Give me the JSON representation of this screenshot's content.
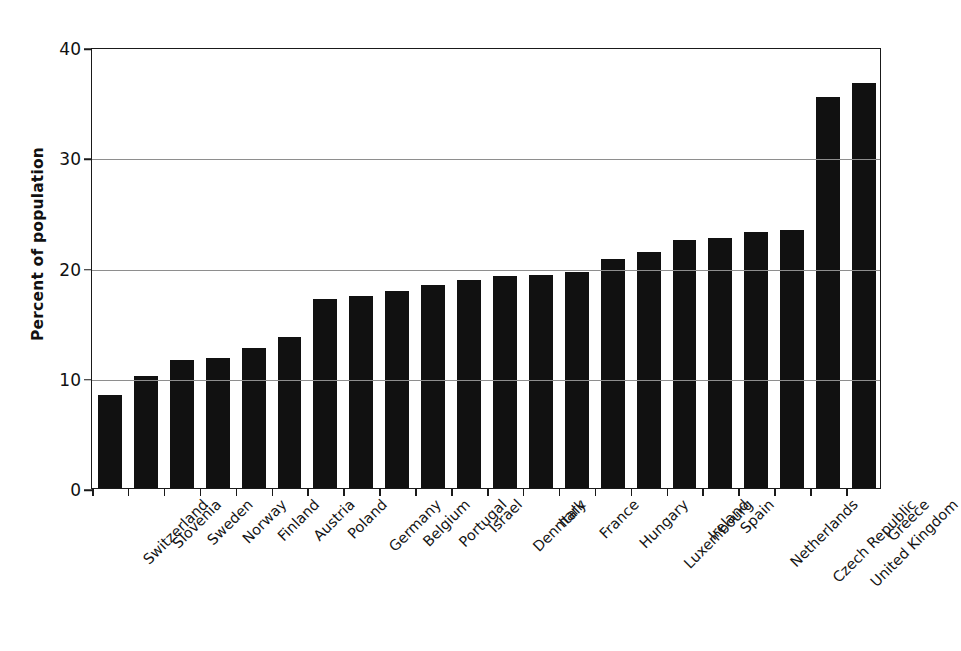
{
  "chart_data": {
    "type": "bar",
    "title": "",
    "subtitle": "",
    "xlabel": "",
    "ylabel": "Percent of population",
    "ylim": [
      0,
      40
    ],
    "yticks": [
      0,
      10,
      20,
      30,
      40
    ],
    "ytick_labels": [
      "0",
      "10",
      "20",
      "30",
      "40"
    ],
    "grid": true,
    "grid_axis": "y",
    "legend": false,
    "legend_position": "none",
    "orientation": "vertical",
    "bar_color": "#111111",
    "categories": [
      "Switzerland",
      "Slovenia",
      "Sweden",
      "Norway",
      "Finland",
      "Austria",
      "Poland",
      "Germany",
      "Belgium",
      "Portugal",
      "Israel",
      "Denmark",
      "Italy",
      "France",
      "Hungary",
      "Luxembourg",
      "Ireland",
      "Spain",
      "Netherlands",
      "Czech Republic",
      "United Kingdom",
      "Greece"
    ],
    "values": [
      8.4,
      10.2,
      11.6,
      11.8,
      12.7,
      13.7,
      17.1,
      17.4,
      17.9,
      18.4,
      18.9,
      19.2,
      19.3,
      19.6,
      20.8,
      21.4,
      22.5,
      22.7,
      23.2,
      23.4,
      35.5,
      36.7
    ]
  },
  "axes": {
    "y_title": "Percent of population"
  }
}
